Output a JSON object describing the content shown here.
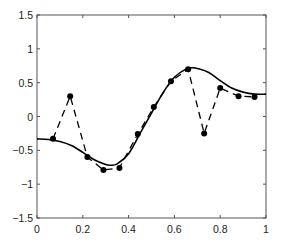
{
  "chart_data": {
    "type": "line",
    "title": "",
    "xlabel": "",
    "ylabel": "",
    "xlim": [
      0,
      1
    ],
    "ylim": [
      -1.5,
      1.5
    ],
    "grid": false,
    "legend": null,
    "xticks": [
      0,
      0.2,
      0.4,
      0.6,
      0.8,
      1
    ],
    "xtick_labels": [
      "0",
      "0.2",
      "0.4",
      "0.6",
      "0.8",
      "1"
    ],
    "yticks": [
      -1.5,
      -1,
      -0.5,
      0,
      0.5,
      1,
      1.5
    ],
    "ytick_labels": [
      "−1.5",
      "−1",
      "−0.5",
      "0",
      "0.5",
      "1",
      "1.5"
    ],
    "series": [
      {
        "name": "smooth curve",
        "style": "solid",
        "color": "#000000",
        "x": [
          0,
          0.05,
          0.1,
          0.15,
          0.2,
          0.25,
          0.3,
          0.32,
          0.35,
          0.4,
          0.45,
          0.5,
          0.55,
          0.6,
          0.65,
          0.68,
          0.7,
          0.75,
          0.8,
          0.85,
          0.9,
          0.95,
          1
        ],
        "y": [
          -0.33,
          -0.34,
          -0.37,
          -0.43,
          -0.53,
          -0.64,
          -0.71,
          -0.72,
          -0.7,
          -0.55,
          -0.25,
          0.05,
          0.35,
          0.58,
          0.7,
          0.72,
          0.71,
          0.65,
          0.53,
          0.42,
          0.36,
          0.33,
          0.33
        ]
      },
      {
        "name": "noisy samples",
        "style": "dashed",
        "marker": "filled-circle",
        "color": "#000000",
        "x": [
          0.07,
          0.145,
          0.22,
          0.29,
          0.36,
          0.44,
          0.51,
          0.585,
          0.66,
          0.73,
          0.8,
          0.88,
          0.95
        ],
        "y": [
          -0.33,
          0.3,
          -0.6,
          -0.79,
          -0.76,
          -0.26,
          0.14,
          0.52,
          0.7,
          -0.25,
          0.42,
          0.3,
          0.29
        ]
      }
    ]
  },
  "colors": {
    "axis": "#555555",
    "line": "#000000",
    "background": "#ffffff"
  }
}
